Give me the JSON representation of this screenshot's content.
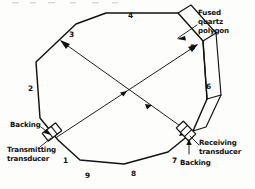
{
  "figure": {
    "background_color": "#fdfdfb",
    "ink_color": "#111111"
  },
  "labels": {
    "fused_quartz": {
      "line1": "Fused",
      "line2": "quartz",
      "line3": "polygon"
    },
    "backing_left": "Backing",
    "backing_right": "Backing",
    "transmitting": {
      "line1": "Transmitting",
      "line2": "transducer"
    },
    "receiving": {
      "line1": "Receiving",
      "line2": "transducer"
    }
  },
  "facet_numbers": {
    "one": "1",
    "two": "2",
    "three": "3",
    "four": "4",
    "five": "5",
    "six": "6",
    "seven": "7",
    "eight": "8",
    "nine": "9"
  },
  "components": [
    {
      "name": "transmitting-transducer",
      "label": "Transmitting transducer",
      "position": "lower-left",
      "facet": "1"
    },
    {
      "name": "receiving-transducer",
      "label": "Receiving transducer",
      "position": "lower-right",
      "facet": "7"
    },
    {
      "name": "backing-left",
      "label": "Backing",
      "position": "left-of-transmitting-transducer"
    },
    {
      "name": "backing-right",
      "label": "Backing",
      "position": "right-of-receiving-transducer"
    },
    {
      "name": "fused-quartz-polygon",
      "label": "Fused quartz polygon",
      "position": "upper-right"
    }
  ],
  "ray_paths": [
    {
      "name": "ray-transmit-to-upper-right",
      "from": "transmitting transducer",
      "to": "facet 5",
      "direction": "up-right"
    },
    {
      "name": "ray-upper-left-to-receive",
      "from": "facet 3",
      "to": "receiving transducer",
      "direction": "down-right"
    }
  ]
}
